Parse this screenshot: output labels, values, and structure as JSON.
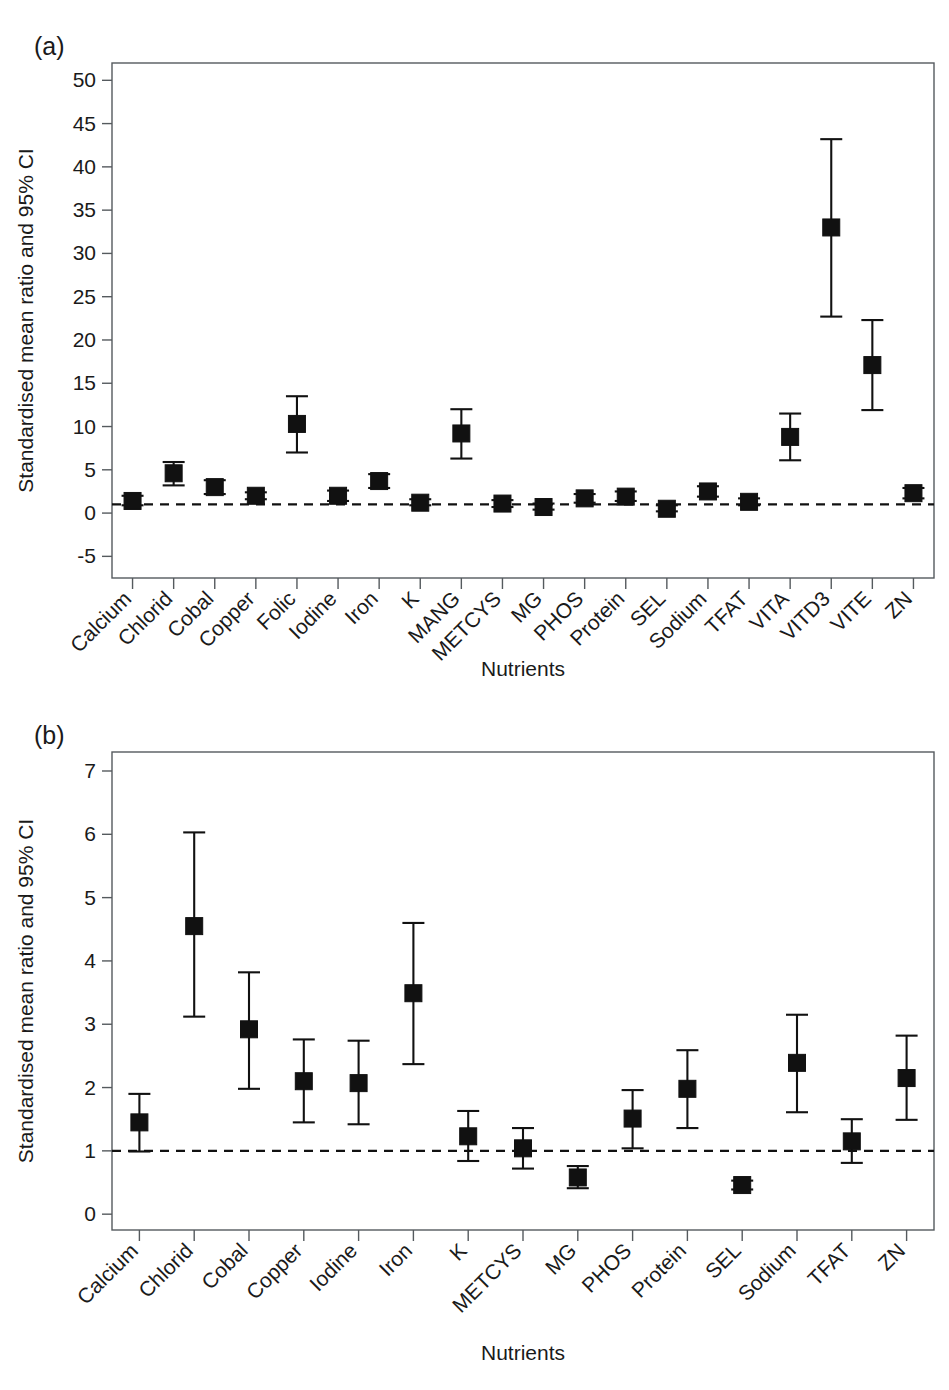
{
  "figure": {
    "panels": [
      {
        "tag": "(a)"
      },
      {
        "tag": "(b)"
      }
    ]
  },
  "chart_data": [
    {
      "type": "scatter",
      "panel": "(a)",
      "title": "",
      "xlabel": "Nutrients",
      "ylabel": "Standardised mean ratio and 95% CI",
      "ylim": [
        -7.5,
        52
      ],
      "yticks": [
        -5,
        0,
        5,
        10,
        15,
        20,
        25,
        30,
        35,
        40,
        45,
        50
      ],
      "ytick_labels": [
        "-5",
        "0",
        "5",
        "10",
        "15",
        "20",
        "25",
        "30",
        "35",
        "40",
        "45",
        "50"
      ],
      "reference_line": 1.0,
      "grid": false,
      "legend": "none",
      "categories": [
        "Calcium",
        "Chlorid",
        "Cobal",
        "Copper",
        "Folic",
        "Iodine",
        "Iron",
        "K",
        "MANG",
        "METCYS",
        "MG",
        "PHOS",
        "Protein",
        "SEL",
        "Sodium",
        "TFAT",
        "VITA",
        "VITD3",
        "VITE",
        "ZN"
      ],
      "values": [
        1.4,
        4.6,
        3.0,
        2.0,
        10.3,
        2.0,
        3.7,
        1.2,
        9.2,
        1.1,
        0.7,
        1.7,
        1.9,
        0.5,
        2.5,
        1.3,
        8.8,
        33.0,
        17.1,
        2.3
      ],
      "ci_lower": [
        0.9,
        3.2,
        2.2,
        1.6,
        7.0,
        1.4,
        2.9,
        0.9,
        6.3,
        0.7,
        0.4,
        1.2,
        1.4,
        0.2,
        1.9,
        0.9,
        6.1,
        22.7,
        11.9,
        1.7
      ],
      "ci_upper": [
        2.0,
        5.9,
        3.8,
        2.4,
        13.5,
        2.6,
        4.5,
        1.6,
        12.0,
        1.5,
        1.1,
        2.2,
        2.5,
        0.9,
        3.1,
        1.7,
        11.5,
        43.2,
        22.3,
        2.9
      ]
    },
    {
      "type": "scatter",
      "panel": "(b)",
      "title": "",
      "xlabel": "Nutrients",
      "ylabel": "Standardised mean ratio and 95% CI",
      "ylim": [
        -0.25,
        7.3
      ],
      "yticks": [
        0,
        1,
        2,
        3,
        4,
        5,
        6,
        7
      ],
      "ytick_labels": [
        "0",
        "1",
        "2",
        "3",
        "4",
        "5",
        "6",
        "7"
      ],
      "reference_line": 1.0,
      "grid": false,
      "legend": "none",
      "categories": [
        "Calcium",
        "Chlorid",
        "Cobal",
        "Copper",
        "Iodine",
        "Iron",
        "K",
        "METCYS",
        "MG",
        "PHOS",
        "Protein",
        "SEL",
        "Sodium",
        "TFAT",
        "ZN"
      ],
      "values": [
        1.45,
        4.55,
        2.92,
        2.1,
        2.07,
        3.49,
        1.23,
        1.04,
        0.58,
        1.51,
        1.98,
        0.46,
        2.39,
        1.15,
        2.15
      ],
      "ci_lower": [
        0.99,
        3.12,
        1.98,
        1.45,
        1.42,
        2.37,
        0.84,
        0.72,
        0.41,
        1.04,
        1.36,
        0.39,
        1.61,
        0.81,
        1.49
      ],
      "ci_upper": [
        1.9,
        6.03,
        3.82,
        2.76,
        2.74,
        4.6,
        1.63,
        1.36,
        0.76,
        1.96,
        2.59,
        0.53,
        3.15,
        1.5,
        2.82
      ]
    }
  ]
}
